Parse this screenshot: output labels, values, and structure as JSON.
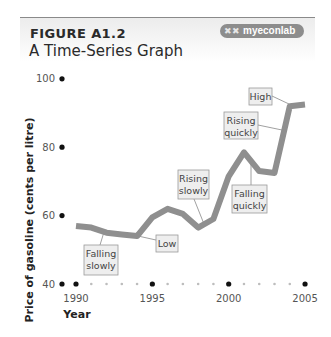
{
  "header": {
    "figure_label": "FIGURE A1.2",
    "title": "A Time-Series Graph",
    "badge_icon": "myeconlab-logo-icon",
    "badge_text": "myeconlab"
  },
  "colors": {
    "line": "#8f8f8f",
    "annotation_box": "#eeeeee",
    "annotation_border": "#9a9a9a",
    "axis_dot": "#111111",
    "minor_dot": "#bdbdbd"
  },
  "chart_data": {
    "type": "line",
    "title": "A Time-Series Graph",
    "xlabel": "Year",
    "ylabel": "Price of gasoline (cents per litre)",
    "xlim": [
      1989,
      2005
    ],
    "ylim": [
      40,
      100
    ],
    "x_ticks": [
      1990,
      1995,
      2000,
      2005
    ],
    "y_ticks": [
      40,
      60,
      80,
      100
    ],
    "grid": false,
    "x": [
      1990,
      1991,
      1992,
      1993,
      1994,
      1995,
      1996,
      1997,
      1998,
      1999,
      2000,
      2001,
      2002,
      2003,
      2004,
      2005
    ],
    "values": [
      57,
      56.5,
      55,
      54.5,
      54,
      59.5,
      62,
      60.5,
      56.5,
      59,
      71.5,
      78.5,
      73,
      72.5,
      92,
      92.5
    ],
    "annotations": [
      {
        "text": "Falling slowly",
        "points_to": 1992
      },
      {
        "text": "Low",
        "points_to": 1994
      },
      {
        "text": "Rising slowly",
        "points_to": 1998.5
      },
      {
        "text": "Falling quickly",
        "points_to": 2001.5
      },
      {
        "text": "Rising quickly",
        "points_to": 2003.5
      },
      {
        "text": "High",
        "points_to": 2004
      }
    ]
  }
}
